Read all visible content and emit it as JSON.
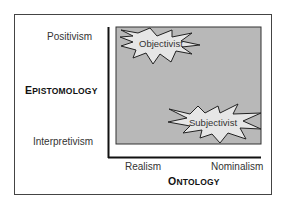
{
  "diagram": {
    "y_axis": {
      "title": "Epistomology",
      "title_first": "E",
      "title_rest": "PISTOMOLOGY",
      "top_label": "Positivism",
      "bottom_label": "Interpretivism"
    },
    "x_axis": {
      "title": "Ontology",
      "title_first": "O",
      "title_rest": "NTOLOGY",
      "left_label": "Realism",
      "right_label": "Nominalism"
    },
    "regions": [
      {
        "label": "Objectivist",
        "position": "top-left"
      },
      {
        "label": "Subjectivist",
        "position": "bottom-right"
      }
    ],
    "colors": {
      "field": "#b8b8b8",
      "star_fill": "#e6e6e6",
      "stroke": "#222222"
    }
  }
}
